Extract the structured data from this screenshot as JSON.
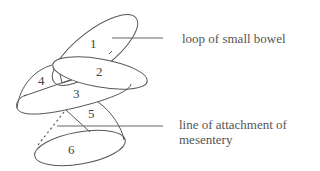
{
  "diagram": {
    "title": "",
    "region_numbers": [
      "1",
      "2",
      "3",
      "4",
      "5",
      "6"
    ],
    "labels": {
      "loop": "loop of small bowel",
      "attachment_line1": "line of attachment of",
      "attachment_line2": "mesentery"
    },
    "colors": {
      "stroke": "#555555",
      "text": "#555555",
      "background": "#ffffff"
    }
  }
}
